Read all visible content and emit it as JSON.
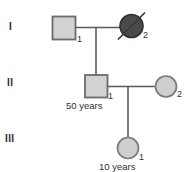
{
  "diagram": {
    "type": "pedigree-chart",
    "generations": [
      {
        "numeral": "I"
      },
      {
        "numeral": "II"
      },
      {
        "numeral": "III"
      }
    ],
    "individuals": [
      {
        "key": "I-1",
        "generation": "I",
        "id": "1",
        "shape": "square",
        "sex": "male",
        "fill": "#d2d2d2",
        "stroke": "#6b6b6b",
        "affected": false,
        "deceased": false,
        "age": ""
      },
      {
        "key": "I-2",
        "generation": "I",
        "id": "2",
        "shape": "circle",
        "sex": "female",
        "fill": "#4a4a4a",
        "stroke": "#2f2f2f",
        "affected": true,
        "deceased": true,
        "age": ""
      },
      {
        "key": "II-1",
        "generation": "II",
        "id": "1",
        "shape": "square",
        "sex": "male",
        "fill": "#d2d2d2",
        "stroke": "#6b6b6b",
        "affected": false,
        "deceased": false,
        "age": "50 years"
      },
      {
        "key": "II-2",
        "generation": "II",
        "id": "2",
        "shape": "circle",
        "sex": "female",
        "fill": "#cfcfcf",
        "stroke": "#7a7a7a",
        "affected": false,
        "deceased": false,
        "age": ""
      },
      {
        "key": "III-1",
        "generation": "III",
        "id": "1",
        "shape": "circle",
        "sex": "female",
        "fill": "#cfcfcf",
        "stroke": "#7a7a7a",
        "affected": false,
        "deceased": false,
        "age": "10 years"
      }
    ],
    "line_color": "#5a5a5a",
    "background": "#ffffff"
  }
}
